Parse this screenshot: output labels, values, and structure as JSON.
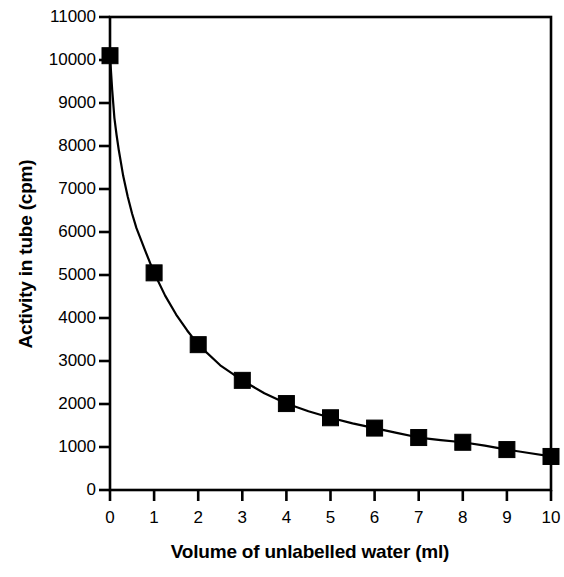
{
  "chart_data": {
    "type": "scatter",
    "title": "",
    "xlabel": "Volume of unlabelled water (ml)",
    "ylabel": "Activity in tube (cpm)",
    "xlim": [
      0,
      10
    ],
    "ylim": [
      0,
      11000
    ],
    "xticks": [
      0,
      1,
      2,
      3,
      4,
      5,
      6,
      7,
      8,
      9,
      10
    ],
    "xtick_labels": [
      "0",
      "1",
      "2",
      "3",
      "4",
      "5",
      "6",
      "7",
      "8",
      "9",
      "10"
    ],
    "yticks": [
      0,
      1000,
      2000,
      3000,
      4000,
      5000,
      6000,
      7000,
      8000,
      9000,
      10000,
      11000
    ],
    "ytick_labels": [
      "0",
      "1000",
      "2000",
      "3000",
      "4000",
      "5000",
      "6000",
      "7000",
      "8000",
      "9000",
      "10000",
      "11000"
    ],
    "grid": false,
    "legend": null,
    "marker": "filled-square",
    "marker_color": "#000000",
    "line_color": "#000000",
    "frame": "box",
    "series": [
      {
        "name": "Activity in tube",
        "x": [
          0,
          1,
          2,
          3,
          4,
          5,
          6,
          7,
          8,
          9,
          10
        ],
        "values": [
          10100,
          5050,
          3380,
          2550,
          2010,
          1680,
          1440,
          1220,
          1110,
          940,
          780
        ]
      }
    ],
    "fit_curve": {
      "description": "smooth decaying curve through data points",
      "x": [
        0.0,
        0.05,
        0.1,
        0.15,
        0.2,
        0.3,
        0.4,
        0.5,
        0.6,
        0.8,
        1.0,
        1.25,
        1.5,
        1.75,
        2.0,
        2.5,
        3.0,
        3.5,
        4.0,
        4.5,
        5.0,
        5.5,
        6.0,
        6.5,
        7.0,
        7.5,
        8.0,
        8.5,
        9.0,
        9.5,
        10.0
      ],
      "y": [
        10100,
        9300,
        8650,
        8250,
        7900,
        7300,
        6830,
        6430,
        6090,
        5560,
        5050,
        4520,
        4080,
        3710,
        3380,
        2900,
        2550,
        2250,
        2010,
        1830,
        1680,
        1550,
        1440,
        1330,
        1220,
        1160,
        1110,
        1030,
        940,
        860,
        780
      ]
    }
  },
  "axes": {
    "y_title": "Activity in tube (cpm)",
    "x_title": "Volume of unlabelled water (ml)"
  }
}
